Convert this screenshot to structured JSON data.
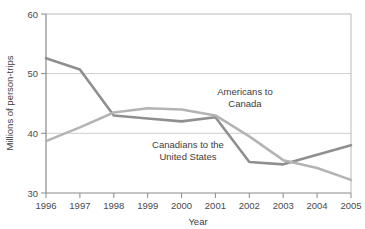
{
  "chart_data": {
    "type": "line",
    "title": "",
    "xlabel": "Year",
    "ylabel": "Millions of person-trips",
    "categories": [
      "1996",
      "1997",
      "1998",
      "1999",
      "2000",
      "2001",
      "2002",
      "2003",
      "2004",
      "2005"
    ],
    "x": [
      1996,
      1997,
      1998,
      1999,
      2000,
      2001,
      2002,
      2003,
      2004,
      2005
    ],
    "xlim": [
      1996,
      2005
    ],
    "ylim": [
      30,
      60
    ],
    "yticks": [
      30,
      40,
      50,
      60
    ],
    "xticks": [
      "1996",
      "1997",
      "1998",
      "1999",
      "2000",
      "2001",
      "2002",
      "2003",
      "2004",
      "2005"
    ],
    "grid": true,
    "grid_axis": "y",
    "legend": "inline-annotations",
    "series": [
      {
        "name": "Canadians to the United States",
        "color": "#8f8f8f",
        "values": [
          52.6,
          50.7,
          43.0,
          42.5,
          42.0,
          42.7,
          35.2,
          34.8,
          36.4,
          38.0
        ]
      },
      {
        "name": "Americans to Canada",
        "color": "#b4b4b4",
        "values": [
          38.7,
          41.0,
          43.5,
          44.2,
          44.0,
          43.0,
          39.5,
          35.5,
          34.2,
          32.2
        ]
      }
    ],
    "annotations": [
      {
        "id": "americans-to-canada",
        "lines": [
          "Americans to",
          "Canada"
        ],
        "x": 245,
        "y": 95
      },
      {
        "id": "canadians-to-united-states",
        "lines": [
          "Canadians to the",
          "United States"
        ],
        "x": 188,
        "y": 148
      }
    ]
  },
  "axis": {
    "y_title": "Millions of person-trips",
    "x_title": "Year",
    "y_tick_labels": [
      "60",
      "50",
      "40",
      "30"
    ],
    "x_tick_labels": [
      "1996",
      "1997",
      "1998",
      "1999",
      "2000",
      "2001",
      "2002",
      "2003",
      "2004",
      "2005"
    ]
  },
  "colors": {
    "series_dark": "#8f8f8f",
    "series_light": "#b4b4b4",
    "grid": "#cfcfcf",
    "axis": "#8a8a8a",
    "text": "#3d3d3d",
    "background": "#ffffff"
  }
}
